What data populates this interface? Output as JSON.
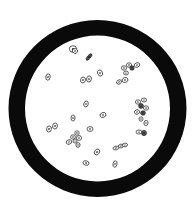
{
  "figure": {
    "kind": "microscope-field-of-view",
    "background": "#ffffff",
    "ring": {
      "color": "#0a0a0a",
      "cx": 97.5,
      "cy": 108.5,
      "outer_rx": 89,
      "outer_ry": 88.5,
      "inner_rx": 72.5,
      "inner_ry": 73
    },
    "cell_stroke": "#1a1a1a",
    "cells": [
      {
        "x": 73,
        "y": 49,
        "rx": 3.6,
        "ry": 3.2,
        "rot": -10
      },
      {
        "x": 75,
        "y": 51,
        "rx": 2.6,
        "ry": 2.4,
        "rot": 20
      },
      {
        "x": 89,
        "y": 57,
        "rx": 4.0,
        "ry": 1.6,
        "rot": -50,
        "dark": true
      },
      {
        "x": 48,
        "y": 77,
        "rx": 2.2,
        "ry": 3.2,
        "rot": 10
      },
      {
        "x": 83,
        "y": 80,
        "rx": 2.4,
        "ry": 3.0,
        "rot": 15
      },
      {
        "x": 89,
        "y": 79,
        "rx": 2.4,
        "ry": 3.0,
        "rot": 15
      },
      {
        "x": 100,
        "y": 73,
        "rx": 2.4,
        "ry": 3.2,
        "rot": -25
      },
      {
        "x": 124,
        "y": 68,
        "rx": 2.6,
        "ry": 2.2,
        "rot": 0
      },
      {
        "x": 129,
        "y": 65,
        "rx": 2.6,
        "ry": 2.2,
        "rot": 0
      },
      {
        "x": 132,
        "y": 68,
        "rx": 2.2,
        "ry": 2.2,
        "rot": 0,
        "dark": true
      },
      {
        "x": 137,
        "y": 65,
        "rx": 2.8,
        "ry": 2.2,
        "rot": -20
      },
      {
        "x": 126,
        "y": 73,
        "rx": 2.4,
        "ry": 2.0,
        "rot": 0
      },
      {
        "x": 119,
        "y": 82,
        "rx": 2.6,
        "ry": 2.0,
        "rot": -30
      },
      {
        "x": 125,
        "y": 80,
        "rx": 3.0,
        "ry": 2.4,
        "rot": -20
      },
      {
        "x": 86,
        "y": 104,
        "rx": 2.2,
        "ry": 3.0,
        "rot": 15
      },
      {
        "x": 73,
        "y": 118,
        "rx": 2.0,
        "ry": 3.0,
        "rot": 0
      },
      {
        "x": 103,
        "y": 115,
        "rx": 3.0,
        "ry": 2.4,
        "rot": -20
      },
      {
        "x": 49,
        "y": 129,
        "rx": 2.4,
        "ry": 3.0,
        "rot": 10
      },
      {
        "x": 55,
        "y": 126,
        "rx": 2.4,
        "ry": 3.0,
        "rot": 10
      },
      {
        "x": 90,
        "y": 129,
        "rx": 3.0,
        "ry": 2.4,
        "rot": 0
      },
      {
        "x": 138,
        "y": 102,
        "rx": 2.6,
        "ry": 2.2,
        "rot": 0
      },
      {
        "x": 144,
        "y": 100,
        "rx": 2.6,
        "ry": 2.0,
        "rot": 0
      },
      {
        "x": 141,
        "y": 106,
        "rx": 2.4,
        "ry": 2.4,
        "rot": 0,
        "dark": true
      },
      {
        "x": 146,
        "y": 108,
        "rx": 2.6,
        "ry": 2.2,
        "rot": 0
      },
      {
        "x": 137,
        "y": 112,
        "rx": 2.6,
        "ry": 2.2,
        "rot": -20
      },
      {
        "x": 143,
        "y": 113,
        "rx": 2.4,
        "ry": 2.2,
        "rot": 0,
        "dark": true
      },
      {
        "x": 141,
        "y": 119,
        "rx": 2.0,
        "ry": 2.2,
        "rot": 0
      },
      {
        "x": 146,
        "y": 123,
        "rx": 2.0,
        "ry": 2.6,
        "rot": 10
      },
      {
        "x": 139,
        "y": 132,
        "rx": 3.0,
        "ry": 2.0,
        "rot": 0
      },
      {
        "x": 144,
        "y": 133,
        "rx": 2.4,
        "ry": 2.6,
        "rot": 0,
        "dark": true
      },
      {
        "x": 77,
        "y": 133,
        "rx": 2.2,
        "ry": 2.2,
        "rot": 0
      },
      {
        "x": 73,
        "y": 137,
        "rx": 2.4,
        "ry": 2.2,
        "rot": 0
      },
      {
        "x": 79,
        "y": 138,
        "rx": 2.6,
        "ry": 2.4,
        "rot": 0
      },
      {
        "x": 69,
        "y": 142,
        "rx": 2.8,
        "ry": 2.2,
        "rot": -20
      },
      {
        "x": 75,
        "y": 141,
        "rx": 2.0,
        "ry": 2.0,
        "rot": 0
      },
      {
        "x": 78,
        "y": 145,
        "rx": 2.0,
        "ry": 2.4,
        "rot": 20
      },
      {
        "x": 97,
        "y": 152,
        "rx": 2.4,
        "ry": 3.2,
        "rot": 35
      },
      {
        "x": 116,
        "y": 148,
        "rx": 3.0,
        "ry": 1.8,
        "rot": -15
      },
      {
        "x": 121,
        "y": 146,
        "rx": 2.6,
        "ry": 1.8,
        "rot": -15
      },
      {
        "x": 125,
        "y": 145,
        "rx": 2.6,
        "ry": 1.8,
        "rot": -10
      },
      {
        "x": 86,
        "y": 163,
        "rx": 3.0,
        "ry": 2.2,
        "rot": 15
      },
      {
        "x": 115,
        "y": 164,
        "rx": 2.0,
        "ry": 3.2,
        "rot": 10
      }
    ]
  }
}
